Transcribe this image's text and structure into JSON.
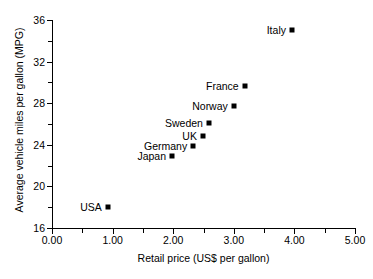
{
  "chart_data": {
    "type": "scatter",
    "title": "",
    "xlabel": "Retail price (US$ per gallon)",
    "ylabel": "Average vehicle miles per gallon (MPG)",
    "xlim": [
      0.0,
      5.0
    ],
    "ylim": [
      16,
      36
    ],
    "xticks": [
      "0.00",
      "1.00",
      "2.00",
      "3.00",
      "4.00",
      "5.00"
    ],
    "xtick_values": [
      0,
      1,
      2,
      3,
      4,
      5
    ],
    "xminor_step": 0.5,
    "yticks": [
      "16",
      "20",
      "24",
      "28",
      "32",
      "36"
    ],
    "ytick_values": [
      16,
      20,
      24,
      28,
      32,
      36
    ],
    "yminor_step": 2,
    "grid": false,
    "legend": "none",
    "marker": "square",
    "marker_color": "#000000",
    "points": [
      {
        "label": "USA",
        "x": 0.92,
        "y": 18.0
      },
      {
        "label": "Japan",
        "x": 1.98,
        "y": 22.9
      },
      {
        "label": "Germany",
        "x": 2.33,
        "y": 23.9
      },
      {
        "label": "UK",
        "x": 2.49,
        "y": 24.8
      },
      {
        "label": "Sweden",
        "x": 2.59,
        "y": 26.1
      },
      {
        "label": "Norway",
        "x": 3.0,
        "y": 27.7
      },
      {
        "label": "France",
        "x": 3.18,
        "y": 29.7
      },
      {
        "label": "Italy",
        "x": 3.96,
        "y": 35.0
      }
    ]
  }
}
